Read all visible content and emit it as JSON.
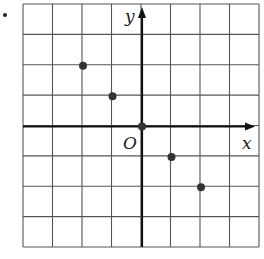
{
  "figure": {
    "bullet": "•",
    "grid": {
      "cols": 8,
      "rows": 8,
      "left": 23,
      "top": 4,
      "right": 259,
      "bottom": 247,
      "line_color": "#555555",
      "axis_color": "#111111"
    },
    "axes": {
      "x_label": "x",
      "y_label": "y",
      "origin_label": "O",
      "origin_col": 4,
      "origin_row": 4
    },
    "points": [
      {
        "x": -2,
        "y": 2
      },
      {
        "x": -1,
        "y": 1
      },
      {
        "x": 0,
        "y": 0
      },
      {
        "x": 1,
        "y": -1
      },
      {
        "x": 2,
        "y": -2
      }
    ],
    "point_color": "#333333"
  }
}
